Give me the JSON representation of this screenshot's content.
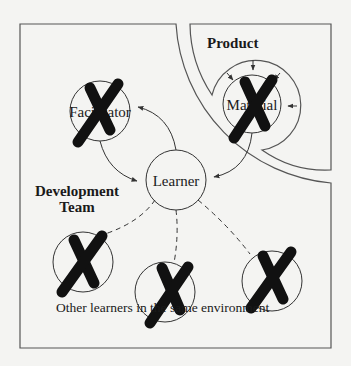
{
  "diagram": {
    "regions": {
      "product": {
        "label": "Product"
      },
      "development_team": {
        "label_line1": "Development",
        "label_line2": "Team"
      }
    },
    "nodes": {
      "facilitator": {
        "label": "Facilitator",
        "crossed_out": true
      },
      "material": {
        "label": "Material",
        "crossed_out": true
      },
      "learner": {
        "label": "Learner",
        "crossed_out": false
      },
      "peer_left": {
        "crossed_out": true
      },
      "peer_middle": {
        "crossed_out": true
      },
      "peer_right": {
        "crossed_out": true
      }
    },
    "peers_caption": "Other learners in the same environment",
    "edges": [
      {
        "from": "facilitator",
        "to": "learner",
        "style": "solid-arrow"
      },
      {
        "from": "learner",
        "to": "facilitator",
        "style": "solid-arrow"
      },
      {
        "from": "material",
        "to": "learner",
        "style": "solid-arrow"
      },
      {
        "from": "learner",
        "to": "peer_left",
        "style": "dashed"
      },
      {
        "from": "learner",
        "to": "peer_middle",
        "style": "dashed"
      },
      {
        "from": "learner",
        "to": "peer_right",
        "style": "dashed"
      }
    ],
    "colors": {
      "line": "#333333",
      "cross": "#111111",
      "background": "#f4f4f2"
    }
  }
}
